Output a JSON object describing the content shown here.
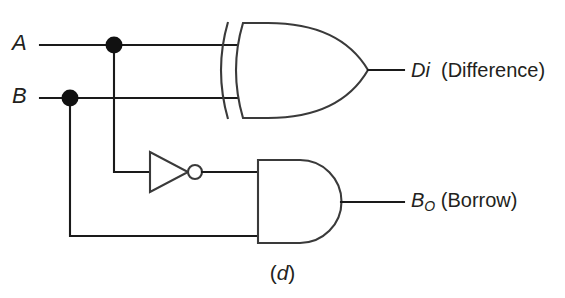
{
  "figure": {
    "caption_open": "(",
    "caption_letter": "d",
    "caption_close": ")",
    "circuit_name": "half-subtractor"
  },
  "inputs": [
    {
      "id": "a",
      "label": "A",
      "y": 45
    },
    {
      "id": "b",
      "label": "B",
      "y": 98
    }
  ],
  "outputs": [
    {
      "id": "di",
      "symbol": "Di",
      "subscript": "",
      "description": "(Difference)",
      "y": 70
    },
    {
      "id": "bo",
      "symbol": "B",
      "subscript": "O",
      "description": "(Borrow)",
      "y": 203
    }
  ],
  "gates": [
    {
      "id": "xor1",
      "type": "XOR",
      "output": "Di"
    },
    {
      "id": "not1",
      "type": "NOT",
      "output": "A-inverted"
    },
    {
      "id": "and1",
      "type": "AND",
      "output": "Bo"
    }
  ],
  "junctions": [
    {
      "id": "dot-a",
      "x": 114,
      "y": 45,
      "on": "A"
    },
    {
      "id": "dot-b",
      "x": 70,
      "y": 98,
      "on": "B"
    }
  ],
  "colors": {
    "background": "#ffffff",
    "wire": "#1a1a1a",
    "gate_outline": "#3a3a3a",
    "text": "#231f20",
    "junction": "#111111"
  }
}
